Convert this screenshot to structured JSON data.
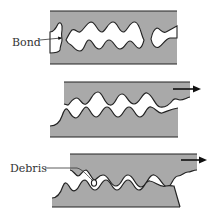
{
  "diagram": {
    "type": "surface-contact-wear-stages",
    "panels": [
      {
        "id": "stage-1",
        "label": "Bond",
        "description": "Asperities of two surfaces in contact forming a bond"
      },
      {
        "id": "stage-2",
        "label": "",
        "description": "Top surface sliding to the right",
        "motion": "right"
      },
      {
        "id": "stage-3",
        "label": "Debris",
        "description": "Sheared asperity leaves wear debris",
        "motion": "right"
      }
    ],
    "colors": {
      "material": "#a9a9a9",
      "outline": "#222222",
      "gap": "#ffffff"
    }
  },
  "labels": {
    "bond": "Bond",
    "debris": "Debris"
  }
}
